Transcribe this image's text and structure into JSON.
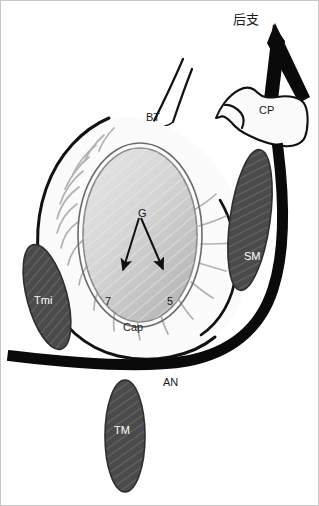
{
  "figure": {
    "background_color": "#ffffff",
    "border_color": "#c8c8c8",
    "width": 319,
    "height": 506
  },
  "colors": {
    "outline": "#111111",
    "muscle_fill": "#4a4a4a",
    "glenoid_light": "#e2e2e2",
    "glenoid_dark": "#b9b9b9",
    "capsule_fill": "#fbfbfb",
    "fiber": "#b0b0b0",
    "nerve_black": "#0a0a0a",
    "label_dark": "#1a1a1a",
    "label_light": "#ffffff"
  },
  "labels": {
    "posterior_branch": {
      "text": "后支",
      "x": 232,
      "y": 12,
      "color": "#1a1a1a"
    },
    "coracoid_process": {
      "text": "CP",
      "x": 258,
      "y": 104,
      "color": "#1a1a1a"
    },
    "biceps_tendon": {
      "text": "BT",
      "x": 145,
      "y": 111,
      "color": "#1a1a1a"
    },
    "glenoid": {
      "text": "G",
      "x": 137,
      "y": 207,
      "color": "#1a1a1a"
    },
    "subscapularis": {
      "text": "SM",
      "x": 243,
      "y": 250,
      "color": "#ffffff"
    },
    "teres_minor": {
      "text": "Tmi",
      "x": 33,
      "y": 294,
      "color": "#ffffff"
    },
    "capsule": {
      "text": "Cap",
      "x": 122,
      "y": 321,
      "color": "#1a1a1a"
    },
    "clock_seven": {
      "text": "7",
      "x": 104,
      "y": 295,
      "color": "#1a1a1a"
    },
    "clock_five": {
      "text": "5",
      "x": 166,
      "y": 295,
      "color": "#1a1a1a"
    },
    "axillary_nerve": {
      "text": "AN",
      "x": 162,
      "y": 376,
      "color": "#1a1a1a"
    },
    "teres_major": {
      "text": "TM",
      "x": 113,
      "y": 424,
      "color": "#ffffff"
    }
  }
}
